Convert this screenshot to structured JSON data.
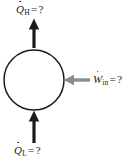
{
  "figure": {
    "type": "thermodynamic-cycle-energy-balance-diagram",
    "background_color": "#ffffff",
    "width": 131,
    "height": 164,
    "system": {
      "shape": "circle",
      "name": "heat-pump-system-boundary",
      "stroke_color": "#1a1a1a",
      "fill": "none",
      "center_x": 34,
      "center_y": 80,
      "radius": 30
    },
    "flows": [
      {
        "id": "heat-rejected",
        "symbol": "Q",
        "dot": true,
        "subscript": "H",
        "equals": "=",
        "value": "?",
        "label_text": "Q̇H = ?",
        "direction": "out-up",
        "arrow_color": "#1a1a1a",
        "arrow_x": 34,
        "arrow_from_y": 48,
        "arrow_to_y": 20
      },
      {
        "id": "heat-absorbed",
        "symbol": "Q",
        "dot": true,
        "subscript": "L",
        "equals": "=",
        "value": "?",
        "label_text": "Q̇L = ?",
        "direction": "in-up",
        "arrow_color": "#1a1a1a",
        "arrow_x": 34,
        "arrow_from_y": 143,
        "arrow_to_y": 112
      },
      {
        "id": "work-input",
        "symbol": "W",
        "dot": true,
        "subscript": "in",
        "equals": "=",
        "value": "?",
        "label_text": "Ẇin = ?",
        "direction": "in-left",
        "arrow_color": "#8c8c8c",
        "arrow_y": 80,
        "arrow_from_x": 90,
        "arrow_to_x": 64
      }
    ]
  }
}
